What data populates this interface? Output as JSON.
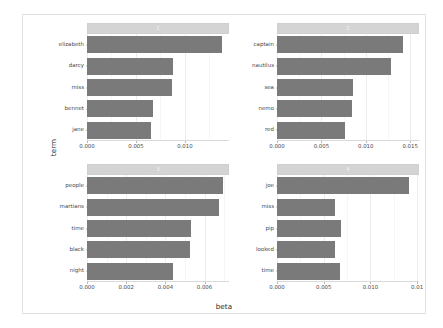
{
  "chart_data": {
    "type": "bar",
    "orientation": "horizontal",
    "title": "",
    "xlabel": "beta",
    "ylabel": "term",
    "grid": true,
    "legend": false,
    "facet_layout": "2x2",
    "panels": [
      {
        "strip_label": "1",
        "categories": [
          "elizabeth",
          "darcy",
          "miss",
          "bennet",
          "jane"
        ],
        "values": [
          0.0138,
          0.0088,
          0.0087,
          0.0067,
          0.0065
        ],
        "xlim": [
          0,
          0.0145
        ],
        "xticks": [
          0.0,
          0.005,
          0.01
        ],
        "xtick_labels": [
          "0.000",
          "0.005",
          "0.010"
        ]
      },
      {
        "strip_label": "2",
        "categories": [
          "captain",
          "nautilus",
          "sea",
          "nemo",
          "red"
        ],
        "values": [
          0.0142,
          0.0128,
          0.0086,
          0.0084,
          0.0077
        ],
        "xlim": [
          0,
          0.016
        ],
        "xticks": [
          0.0,
          0.005,
          0.01,
          0.015
        ],
        "xtick_labels": [
          "0.000",
          "0.005",
          "0.010",
          "0.015"
        ]
      },
      {
        "strip_label": "3",
        "categories": [
          "people",
          "martians",
          "time",
          "black",
          "night"
        ],
        "values": [
          0.00695,
          0.00672,
          0.00532,
          0.00528,
          0.00438
        ],
        "xlim": [
          0,
          0.00725
        ],
        "xticks": [
          0.0,
          0.002,
          0.004,
          0.006
        ],
        "xtick_labels": [
          "0.000",
          "0.002",
          "0.004",
          "0.006"
        ]
      },
      {
        "strip_label": "4",
        "categories": [
          "joe",
          "miss",
          "pip",
          "looked",
          "time"
        ],
        "values": [
          0.0141,
          0.0062,
          0.0068,
          0.0062,
          0.0067
        ],
        "xlim": [
          0,
          0.0152
        ],
        "xticks": [
          0.0,
          0.005,
          0.01,
          0.015
        ],
        "xtick_labels": [
          "0.000",
          "0.005",
          "0.010",
          "0.01"
        ]
      }
    ],
    "colors": {
      "bar_fill": "#7a7a7a",
      "strip_fill": "#d4d4d4",
      "strip_text": "#f2f2f2",
      "panel_background": "#ffffff",
      "gridline": "#ededed",
      "axis_text": "#4a4a4a",
      "axis_title": "#2b2b2b",
      "figure_border": "#e2e2e2"
    }
  }
}
